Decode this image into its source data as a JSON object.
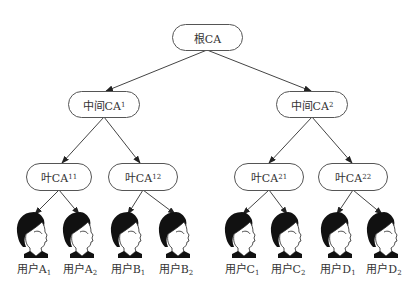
{
  "diagram": {
    "type": "tree",
    "title": "",
    "edge_color": "#444444",
    "node_border_color": "#555555",
    "nodes": {
      "root": {
        "label": "根CA",
        "sub": ""
      },
      "mid1": {
        "label": "中间CA",
        "sub": "1"
      },
      "mid2": {
        "label": "中间CA",
        "sub": "2"
      },
      "leaf11": {
        "label": "叶CA",
        "sub": "11"
      },
      "leaf12": {
        "label": "叶CA",
        "sub": "12"
      },
      "leaf21": {
        "label": "叶CA",
        "sub": "21"
      },
      "leaf22": {
        "label": "叶CA",
        "sub": "22"
      }
    },
    "users": [
      {
        "label": "用户A",
        "sub": "1",
        "icon": "user-face-icon"
      },
      {
        "label": "用户A",
        "sub": "2",
        "icon": "user-face-icon"
      },
      {
        "label": "用户B",
        "sub": "1",
        "icon": "user-face-icon"
      },
      {
        "label": "用户B",
        "sub": "2",
        "icon": "user-face-icon"
      },
      {
        "label": "用户C",
        "sub": "1",
        "icon": "user-face-icon"
      },
      {
        "label": "用户C",
        "sub": "2",
        "icon": "user-face-icon"
      },
      {
        "label": "用户D",
        "sub": "1",
        "icon": "user-face-icon"
      },
      {
        "label": "用户D",
        "sub": "2",
        "icon": "user-face-icon"
      }
    ],
    "edges": [
      [
        "root",
        "mid1"
      ],
      [
        "root",
        "mid2"
      ],
      [
        "mid1",
        "leaf11"
      ],
      [
        "mid1",
        "leaf12"
      ],
      [
        "mid2",
        "leaf21"
      ],
      [
        "mid2",
        "leaf22"
      ],
      [
        "leaf11",
        "user A1"
      ],
      [
        "leaf11",
        "user A2"
      ],
      [
        "leaf12",
        "user B1"
      ],
      [
        "leaf12",
        "user B2"
      ],
      [
        "leaf21",
        "user C1"
      ],
      [
        "leaf21",
        "user C2"
      ],
      [
        "leaf22",
        "user D1"
      ],
      [
        "leaf22",
        "user D2"
      ]
    ]
  }
}
